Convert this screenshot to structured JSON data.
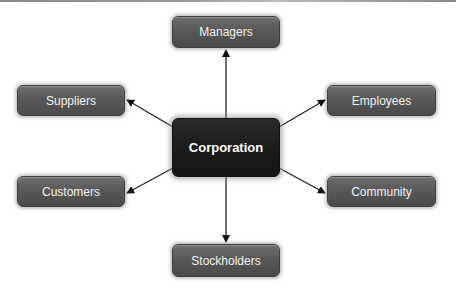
{
  "diagram": {
    "center": {
      "label": "Corporation"
    },
    "nodes": [
      {
        "id": "managers",
        "label": "Managers"
      },
      {
        "id": "suppliers",
        "label": "Suppliers"
      },
      {
        "id": "employees",
        "label": "Employees"
      },
      {
        "id": "customers",
        "label": "Customers"
      },
      {
        "id": "community",
        "label": "Community"
      },
      {
        "id": "stockholders",
        "label": "Stockholders"
      }
    ],
    "edges": [
      {
        "from": "Corporation",
        "to": "Managers"
      },
      {
        "from": "Corporation",
        "to": "Suppliers"
      },
      {
        "from": "Corporation",
        "to": "Employees"
      },
      {
        "from": "Corporation",
        "to": "Customers"
      },
      {
        "from": "Corporation",
        "to": "Community"
      },
      {
        "from": "Corporation",
        "to": "Stockholders"
      }
    ]
  }
}
